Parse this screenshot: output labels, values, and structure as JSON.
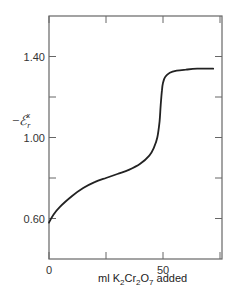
{
  "chart_data": {
    "type": "line",
    "title": "",
    "xlabel": "ml K2Cr2O7 added",
    "xlabel_parts": {
      "pre": "ml K",
      "s1": "2",
      "mid1": "Cr",
      "s2": "2",
      "mid2": "O",
      "s3": "7",
      "post": " added"
    },
    "ylabel": "-E_r^x",
    "ylabel_parts": {
      "minus": "−",
      "symbol": "ℰ",
      "sub": "r",
      "sup": "x"
    },
    "xlim": [
      0,
      76
    ],
    "ylim": [
      0.4,
      1.6
    ],
    "x_ticks": [
      0,
      25,
      50,
      75
    ],
    "x_tick_labels": [
      "0",
      "",
      "50",
      ""
    ],
    "y_ticks": [
      0.6,
      0.8,
      1.0,
      1.2,
      1.4
    ],
    "y_tick_labels": [
      "0.60",
      "",
      "1.00",
      "",
      "1.40"
    ],
    "grid": false,
    "legend": null,
    "series": [
      {
        "name": "titration curve",
        "x": [
          0,
          2,
          5,
          10,
          15,
          20,
          25,
          30,
          35,
          40,
          44,
          46,
          47.5,
          48.5,
          49,
          49.5,
          50,
          51,
          53,
          56,
          60,
          65,
          72
        ],
        "y": [
          0.58,
          0.62,
          0.66,
          0.71,
          0.75,
          0.78,
          0.8,
          0.82,
          0.84,
          0.87,
          0.91,
          0.95,
          1.0,
          1.08,
          1.16,
          1.23,
          1.27,
          1.3,
          1.32,
          1.33,
          1.335,
          1.34,
          1.34
        ]
      }
    ]
  }
}
